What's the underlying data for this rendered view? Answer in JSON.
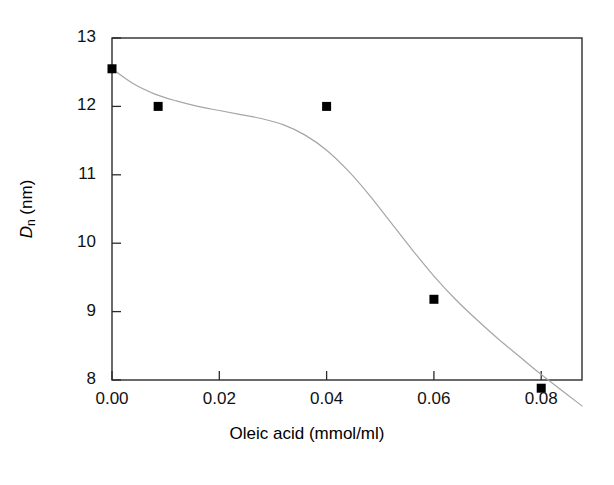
{
  "chart_data": {
    "type": "scatter",
    "title": "",
    "xlabel": "Oleic acid (mmol/ml)",
    "ylabel": "D_n (nm)",
    "ylabel_parts": {
      "symbol": "D",
      "subscript": "n",
      "units": " (nm)"
    },
    "xlim": [
      0.0,
      0.0876
    ],
    "ylim": [
      8.0,
      13.0
    ],
    "xticks": [
      0.0,
      0.02,
      0.04,
      0.06,
      0.08
    ],
    "xtick_labels": [
      "0.00",
      "0.02",
      "0.04",
      "0.06",
      "0.08"
    ],
    "yticks": [
      8,
      9,
      10,
      11,
      12,
      13
    ],
    "ytick_labels": [
      "8",
      "9",
      "10",
      "11",
      "12",
      "13"
    ],
    "grid": false,
    "legend": null,
    "marker": {
      "shape": "square",
      "color": "#000000",
      "size": 9
    },
    "line": {
      "style": "smooth-fit",
      "color": "#9a9a9a",
      "width": 1.1
    },
    "x": [
      0.0,
      0.0086,
      0.04,
      0.06,
      0.08
    ],
    "y": [
      12.55,
      12.0,
      12.0,
      9.18,
      7.88
    ],
    "points": [
      {
        "x": 0.0,
        "y": 12.55
      },
      {
        "x": 0.0086,
        "y": 12.0
      },
      {
        "x": 0.04,
        "y": 12.0
      },
      {
        "x": 0.06,
        "y": 9.18
      },
      {
        "x": 0.08,
        "y": 7.88
      }
    ],
    "fit_curve": [
      {
        "x": 0.0,
        "y": 12.55
      },
      {
        "x": 0.004,
        "y": 12.33
      },
      {
        "x": 0.008,
        "y": 12.18
      },
      {
        "x": 0.012,
        "y": 12.08
      },
      {
        "x": 0.016,
        "y": 12.0
      },
      {
        "x": 0.02,
        "y": 11.94
      },
      {
        "x": 0.024,
        "y": 11.88
      },
      {
        "x": 0.028,
        "y": 11.82
      },
      {
        "x": 0.032,
        "y": 11.73
      },
      {
        "x": 0.036,
        "y": 11.58
      },
      {
        "x": 0.04,
        "y": 11.36
      },
      {
        "x": 0.044,
        "y": 11.06
      },
      {
        "x": 0.048,
        "y": 10.7
      },
      {
        "x": 0.052,
        "y": 10.3
      },
      {
        "x": 0.056,
        "y": 9.9
      },
      {
        "x": 0.06,
        "y": 9.52
      },
      {
        "x": 0.064,
        "y": 9.18
      },
      {
        "x": 0.068,
        "y": 8.88
      },
      {
        "x": 0.072,
        "y": 8.6
      },
      {
        "x": 0.076,
        "y": 8.34
      },
      {
        "x": 0.08,
        "y": 8.08
      },
      {
        "x": 0.0876,
        "y": 7.62
      }
    ]
  }
}
